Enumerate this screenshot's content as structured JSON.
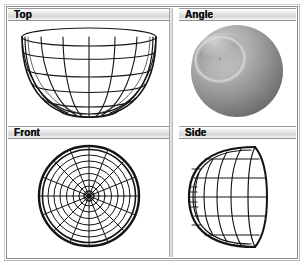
{
  "app": {
    "title": "3D Viewport Grid",
    "background_color": "#ffffff",
    "frame_color": "#8d8d8d"
  },
  "viewports": [
    {
      "id": "top",
      "label": "Top",
      "position": "top-left",
      "display_mode": "wireframe",
      "object": "hemispherical bowl",
      "wireframe": {
        "meridians": 8,
        "rings": 5,
        "projection": "perspective-angled"
      }
    },
    {
      "id": "angle",
      "label": "Angle",
      "position": "top-right",
      "display_mode": "shaded",
      "object": "hemispherical bowl",
      "shading": {
        "base_color": "#9a9a9a",
        "highlight_color": "#d8d8d8",
        "shadow_color": "#5e5e5e",
        "light_direction": "upper-left"
      }
    },
    {
      "id": "front",
      "label": "Front",
      "position": "bottom-left",
      "display_mode": "wireframe",
      "object": "hemispherical bowl",
      "wireframe": {
        "spokes": 16,
        "rings": 8,
        "projection": "orthographic-radial"
      }
    },
    {
      "id": "side",
      "label": "Side",
      "position": "bottom-right",
      "display_mode": "wireframe",
      "object": "hemispherical bowl",
      "wireframe": {
        "meridians": 7,
        "rings": 5,
        "projection": "orthographic-profile"
      }
    }
  ],
  "colors": {
    "wireframe_stroke": "#141414",
    "titlebar_text": "#111111",
    "titlebar_fill": "#dcdcdc"
  }
}
